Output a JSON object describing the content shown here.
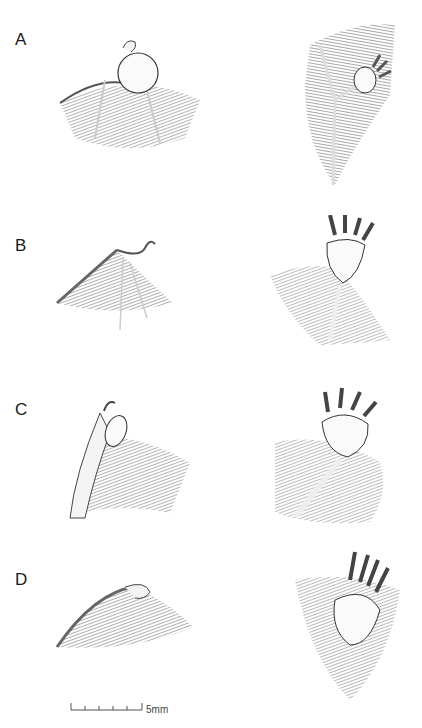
{
  "figure": {
    "panels": [
      {
        "label": "A",
        "left": "wing membrane with round adhesive pad at wrist (lateral view)",
        "right": "foot with oval adhesive pad on membrane (ventral view)"
      },
      {
        "label": "B",
        "left": "wing membrane with small wrist structure (lateral view)",
        "right": "foot with clawed toes and shield-shaped pad (ventral view)"
      },
      {
        "label": "C",
        "left": "forearm with oval pad at wrist (lateral view)",
        "right": "foot with clawed toes and rounded pad on limb (ventral view)"
      },
      {
        "label": "D",
        "left": "wing membrane with small wrist pad (lateral view)",
        "right": "foot with clawed toes and pad on membrane (ventral view)"
      }
    ],
    "scale_bar": {
      "label": "5mm",
      "ticks": 6
    }
  }
}
